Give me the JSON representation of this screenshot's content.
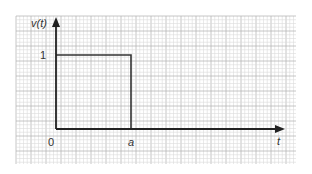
{
  "chart_data": {
    "type": "line",
    "title": "",
    "xlabel": "t",
    "ylabel": "v(t)",
    "x_ticks": [
      {
        "value": 0,
        "label": "0"
      },
      {
        "value": 1,
        "label": "a"
      }
    ],
    "y_ticks": [
      {
        "value": 1,
        "label": "1"
      }
    ],
    "xlim": [
      0,
      3
    ],
    "ylim": [
      0,
      1.3
    ],
    "grid": true,
    "series": [
      {
        "name": "v(t)",
        "points": [
          [
            0,
            1
          ],
          [
            1,
            1
          ],
          [
            1,
            0
          ],
          [
            3,
            0
          ]
        ]
      }
    ]
  },
  "colors": {
    "grid_minor": "#dcdcdc",
    "grid_major": "#b8b8b8",
    "axis": "#222222",
    "signal": "#333333"
  }
}
